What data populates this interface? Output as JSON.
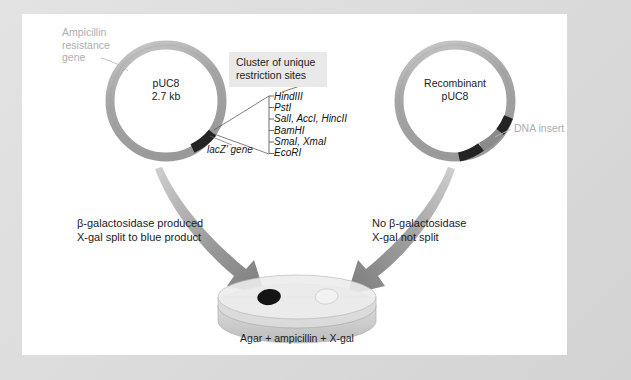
{
  "figure": {
    "colors": {
      "frame": "#dcdcdc",
      "panel": "#ffffff",
      "plasmid_ring": "#a9a9a9",
      "plasmid_ring_light": "#c4c4c4",
      "dark_segment": "#232323",
      "insert_segment": "#8a8a8a",
      "arrow": "#8d8d8d",
      "gray_text": "#aeaeae",
      "box_bg": "#e9e9e9",
      "dish": "#d6d6d6",
      "blue_colony": "#141414",
      "white_colony": "#f2f2f2"
    }
  },
  "left_plasmid": {
    "name_line1": "pUC8",
    "name_line2": "2.7 kb",
    "ampicillin_label": "Ampicillin resistance gene",
    "lacz_label": "lacZ′ gene",
    "cluster_label_line1": "Cluster of unique",
    "cluster_label_line2": "restriction sites",
    "restriction_sites": [
      "HindIII",
      "PstI",
      "SalI, AccI, HincII",
      "BamHI",
      "SmaI, XmaI",
      "EcoRI"
    ]
  },
  "right_plasmid": {
    "name_line1": "Recombinant",
    "name_line2": "pUC8",
    "insert_label": "DNA insert"
  },
  "left_outcome": {
    "line1": "β-galactosidase produced",
    "line2": "X-gal split to blue product"
  },
  "right_outcome": {
    "line1": "No β-galactosidase",
    "line2": "X-gal not split"
  },
  "plate": {
    "caption": "Agar + ampicillin + X-gal",
    "colonies": [
      {
        "name": "blue-colony",
        "color": "#141414"
      },
      {
        "name": "white-colony",
        "color": "#f2f2f2"
      }
    ]
  }
}
